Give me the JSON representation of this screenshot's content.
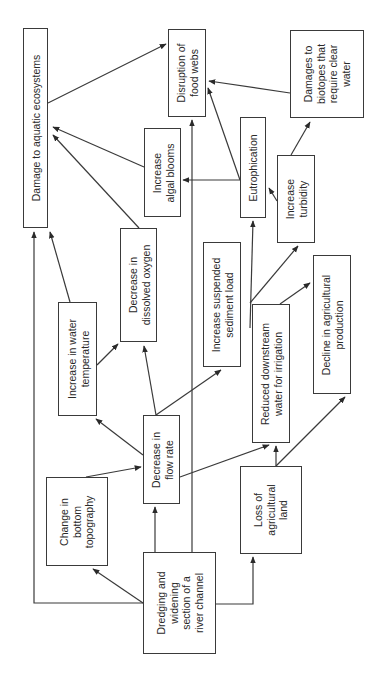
{
  "diagram": {
    "orientation": "rotated-90-ccw",
    "colors": {
      "line": "#3a3a3a",
      "text": "#2a2a2a",
      "background": "#ffffff"
    },
    "nodes": [
      {
        "id": "damage",
        "label": "Damage to aquatic ecosystems",
        "x": 23,
        "y": 28,
        "w": 25,
        "h": 200
      },
      {
        "id": "foodwebs",
        "label": "Disruption of\nfood webs",
        "x": 168,
        "y": 29,
        "w": 38,
        "h": 88
      },
      {
        "id": "biotopes",
        "label": "Damages to\nbiotopes that\nrequire clear\nwater",
        "x": 290,
        "y": 30,
        "w": 74,
        "h": 88
      },
      {
        "id": "algal",
        "label": "Increase\nalgal blooms",
        "x": 144,
        "y": 128,
        "w": 37,
        "h": 89
      },
      {
        "id": "eutro",
        "label": "Eutrophication",
        "x": 240,
        "y": 117,
        "w": 26,
        "h": 101
      },
      {
        "id": "turbidity",
        "label": "Increase\nturbidity",
        "x": 277,
        "y": 155,
        "w": 38,
        "h": 88
      },
      {
        "id": "oxygen",
        "label": "Decrease in\ndissolved oxygen",
        "x": 120,
        "y": 228,
        "w": 37,
        "h": 114
      },
      {
        "id": "temp",
        "label": "Increase in water\ntemperature",
        "x": 58,
        "y": 302,
        "w": 39,
        "h": 114
      },
      {
        "id": "sediment",
        "label": "Increase suspended\nsediment load",
        "x": 203,
        "y": 242,
        "w": 38,
        "h": 125
      },
      {
        "id": "irrigation",
        "label": "Reduced downstream\nwater for irrigation",
        "x": 252,
        "y": 304,
        "w": 38,
        "h": 139
      },
      {
        "id": "agriprod",
        "label": "Decline in agricultural\nproduction",
        "x": 313,
        "y": 255,
        "w": 38,
        "h": 139
      },
      {
        "id": "flow",
        "label": "Decrease in\nflow rate",
        "x": 143,
        "y": 415,
        "w": 37,
        "h": 89
      },
      {
        "id": "topo",
        "label": "Change in\nbottom\ntopography",
        "x": 46,
        "y": 477,
        "w": 62,
        "h": 89
      },
      {
        "id": "dredging",
        "label": "Dredging and\nwidening\nsection of a\nriver channel",
        "x": 143,
        "y": 552,
        "w": 73,
        "h": 102
      },
      {
        "id": "agriland",
        "label": "Loss of\nagricultural\nland",
        "x": 240,
        "y": 466,
        "w": 62,
        "h": 88
      }
    ],
    "edges": [
      {
        "from": "damage",
        "to": "foodwebs",
        "points": [
          [
            48,
            103
          ],
          [
            166,
            44
          ]
        ],
        "arrow": true
      },
      {
        "from": "algal",
        "to": "damage",
        "points": [
          [
            144,
            167
          ],
          [
            53,
            127
          ]
        ],
        "arrow": true
      },
      {
        "from": "oxygen",
        "to": "damage",
        "points": [
          [
            139,
            228
          ],
          [
            53,
            135
          ]
        ],
        "arrow": true
      },
      {
        "from": "temp",
        "to": "damage",
        "points": [
          [
            70,
            302
          ],
          [
            50,
            232
          ]
        ],
        "arrow": true
      },
      {
        "from": "dredging",
        "to": "damage",
        "points": [
          [
            143,
            603
          ],
          [
            34,
            603
          ],
          [
            34,
            232
          ]
        ],
        "arrow": true
      },
      {
        "from": "biotopes",
        "to": "foodwebs",
        "points": [
          [
            290,
            93
          ],
          [
            209,
            81
          ]
        ],
        "arrow": true
      },
      {
        "from": "eutro",
        "to": "foodwebs",
        "points": [
          [
            240,
            180
          ],
          [
            208,
            88
          ]
        ],
        "arrow": true
      },
      {
        "from": "eutro",
        "to": "algal",
        "points": [
          [
            240,
            180
          ],
          [
            183,
            180
          ]
        ],
        "arrow": true
      },
      {
        "from": "dredging",
        "to": "foodwebs",
        "points": [
          [
            192,
            552
          ],
          [
            192,
            120
          ]
        ],
        "arrow": true
      },
      {
        "from": "turbidity",
        "to": "eutro",
        "points": [
          [
            277,
            201
          ],
          [
            269,
            188
          ]
        ],
        "arrow": true
      },
      {
        "from": "turbidity",
        "to": "biotopes",
        "points": [
          [
            291,
            155
          ],
          [
            310,
            122
          ]
        ],
        "arrow": true
      },
      {
        "from": "sediment",
        "to": "eutro",
        "points": [
          [
            250,
            328
          ],
          [
            253,
            221
          ]
        ],
        "arrow": true
      },
      {
        "from": "sediment",
        "to": "turbidity",
        "points": [
          [
            250,
            303
          ],
          [
            298,
            246
          ]
        ],
        "arrow": true
      },
      {
        "from": "temp",
        "to": "oxygen",
        "points": [
          [
            97,
            365
          ],
          [
            118,
            344
          ]
        ],
        "arrow": true
      },
      {
        "from": "flow",
        "to": "oxygen",
        "points": [
          [
            156,
            415
          ],
          [
            144,
            346
          ]
        ],
        "arrow": true
      },
      {
        "from": "flow",
        "to": "temp",
        "points": [
          [
            143,
            455
          ],
          [
            96,
            419
          ]
        ],
        "arrow": true
      },
      {
        "from": "flow",
        "to": "sediment",
        "points": [
          [
            156,
            415
          ],
          [
            221,
            370
          ]
        ],
        "arrow": true
      },
      {
        "from": "flow",
        "to": "irrigation",
        "points": [
          [
            180,
            477
          ],
          [
            269,
            445
          ]
        ],
        "arrow": true
      },
      {
        "from": "topo",
        "to": "flow",
        "points": [
          [
            86,
            477
          ],
          [
            141,
            467
          ]
        ],
        "arrow": true
      },
      {
        "from": "dredging",
        "to": "topo",
        "points": [
          [
            143,
            603
          ],
          [
            93,
            569
          ]
        ],
        "arrow": true
      },
      {
        "from": "dredging",
        "to": "flow",
        "points": [
          [
            155,
            552
          ],
          [
            155,
            507
          ]
        ],
        "arrow": true
      },
      {
        "from": "dredging",
        "to": "agriland",
        "points": [
          [
            216,
            604
          ],
          [
            253,
            604
          ],
          [
            253,
            557
          ]
        ],
        "arrow": true
      },
      {
        "from": "irrigation",
        "to": "agriprod",
        "points": [
          [
            280,
            304
          ],
          [
            310,
            283
          ]
        ],
        "arrow": true
      },
      {
        "from": "agriland",
        "to": "irrigation",
        "points": [
          [
            276,
            466
          ],
          [
            276,
            446
          ]
        ],
        "arrow": true
      },
      {
        "from": "agriland",
        "to": "agriprod",
        "points": [
          [
            276,
            466
          ],
          [
            345,
            397
          ]
        ],
        "arrow": true
      }
    ]
  }
}
